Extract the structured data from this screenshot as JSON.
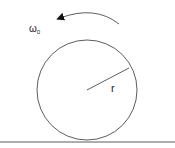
{
  "diagram": {
    "omega_label": "ω",
    "omega_subscript": "0",
    "radius_label": "r",
    "stroke_color": "#333333"
  }
}
